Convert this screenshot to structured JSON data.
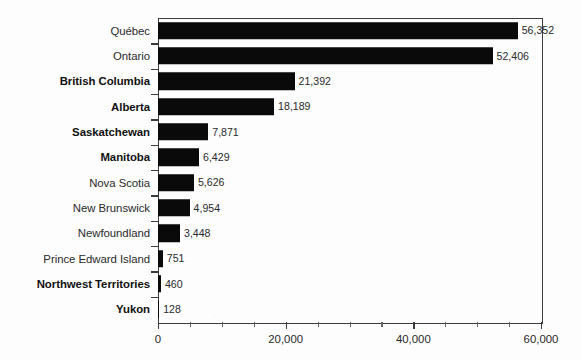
{
  "chart_data": {
    "type": "bar",
    "orientation": "horizontal",
    "title": "",
    "subtitle": "",
    "xlabel": "",
    "ylabel": "",
    "xlim": [
      0,
      60000
    ],
    "ylim": null,
    "grid": false,
    "legend": null,
    "legend_position": "none",
    "bar_color": "#0a0a0a",
    "axis_color": "#3c3c3c",
    "background_color": "#fdfdfd",
    "value_label_position": "outside-end",
    "categories": [
      "Québec",
      "Ontario",
      "British Columbia",
      "Alberta",
      "Saskatchewan",
      "Manitoba",
      "Nova Scotia",
      "New Brunswick",
      "Newfoundland",
      "Prince Edward Island",
      "Northwest Territories",
      "Yukon"
    ],
    "values": [
      56352,
      52406,
      21392,
      18189,
      7871,
      6429,
      5626,
      4954,
      3448,
      751,
      460,
      128
    ],
    "value_labels": [
      "56,352",
      "52,406",
      "21,392",
      "18,189",
      "7,871",
      "6,429",
      "5,626",
      "4,954",
      "3,448",
      "751",
      "460",
      "128"
    ],
    "category_label_bold": [
      false,
      false,
      true,
      true,
      true,
      true,
      false,
      false,
      false,
      false,
      true,
      true
    ],
    "xticks": [
      0,
      5000,
      10000,
      15000,
      20000,
      25000,
      30000,
      35000,
      40000,
      45000,
      50000,
      55000,
      60000
    ],
    "xtick_major": [
      0,
      20000,
      40000,
      60000
    ],
    "xtick_labels": [
      "0",
      "20,000",
      "40,000",
      "60,000"
    ]
  }
}
